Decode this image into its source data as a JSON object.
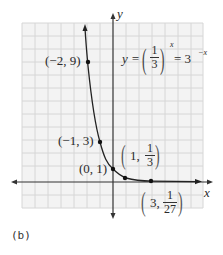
{
  "figure": {
    "caption": "(b)",
    "axis_labels": {
      "x": "x",
      "y": "y"
    },
    "equation": {
      "lhs": "y =",
      "frac_num": "1",
      "frac_den": "3",
      "exp": "x",
      "rhs": "= 3",
      "rhs_exp": "−x"
    },
    "points": [
      {
        "label": "(−2, 9)",
        "x": -2,
        "y": 9
      },
      {
        "label": "(−1, 3)",
        "x": -1,
        "y": 3
      },
      {
        "label": "(0, 1)",
        "x": 0,
        "y": 1
      },
      {
        "label": "(1, 1/3)",
        "x": 1,
        "y": 0.3333,
        "prefix": "1,",
        "num": "1",
        "den": "3"
      },
      {
        "label": "(3, 1/27)",
        "x": 3,
        "y": 0.037,
        "prefix": "3,",
        "num": "1",
        "den": "27"
      }
    ],
    "colors": {
      "grid": "#d9d9d9",
      "grid_bg": "#f2f2f2",
      "axis": "#333333",
      "curve": "#222222"
    }
  }
}
